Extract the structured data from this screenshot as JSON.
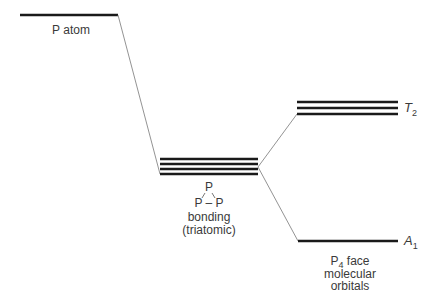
{
  "diagram": {
    "type": "energy-level-diagram",
    "levels": {
      "p_atom": {
        "label": "P atom",
        "y": 15,
        "x1": 20,
        "x2": 118,
        "count": 1
      },
      "bonding": {
        "label_line1": "bonding",
        "label_line2": "(triatomic)",
        "structure_top": "P",
        "structure_bottom": "P – P",
        "ys": [
          159,
          164,
          169,
          174
        ],
        "x1": 160,
        "x2": 258
      },
      "t2": {
        "symbol": "T",
        "subscript": "2",
        "ys": [
          102,
          108,
          114
        ],
        "x1": 297,
        "x2": 398
      },
      "a1": {
        "symbol": "A",
        "subscript": "1",
        "y": 241,
        "x1": 298,
        "x2": 398
      }
    },
    "p4_label": {
      "line1_main": "P",
      "line1_sub": "4",
      "line1_rest": " face",
      "line2": "molecular",
      "line3": "orbitals"
    },
    "colors": {
      "level": "#1a1a1a",
      "connector": "#777777",
      "text": "#3a3a3a"
    }
  }
}
